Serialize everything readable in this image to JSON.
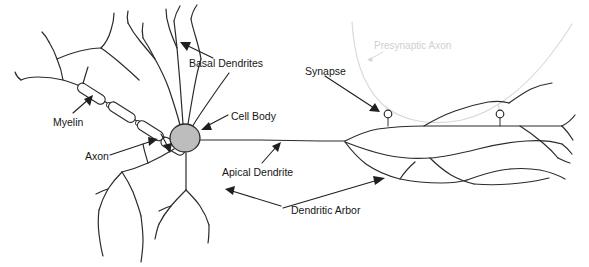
{
  "figure": {
    "background_color": "#ffffff",
    "width": 589,
    "height": 267
  },
  "colors": {
    "ink": "#2b2b2b",
    "label_text": "#161616",
    "faint": "#d8d8d8",
    "faint_text": "#cfcfcf",
    "soma_fill": "#bdbdbd",
    "terminal_fill": "#ffffff"
  },
  "labels": {
    "basal_dendrites": "Basal Dendrites",
    "myelin": "Myelin",
    "axon": "Axon",
    "cell_body": "Cell Body",
    "apical_dendrite": "Apical Dendrite",
    "dendritic_arbor": "Dendritic Arbor",
    "synapse": "Synapse",
    "presynaptic_axon": "Presynaptic Axon"
  },
  "structures": {
    "soma": {
      "name": "cell-body",
      "cx": 185,
      "cy": 138,
      "rx": 15,
      "ry": 14,
      "fill": "#bdbdbd"
    },
    "myelin_segments": 4,
    "nodes_of_ranvier": 4,
    "synaptic_terminals": [
      {
        "x": 388,
        "y": 114
      },
      {
        "x": 500,
        "y": 114
      }
    ],
    "presynaptic_axon_style": "faint-gray-curve"
  },
  "annotations": [
    {
      "label": "Basal Dendrites",
      "points_to": "basal-dendrites",
      "arrow": true
    },
    {
      "label": "Myelin",
      "points_to": "myelin-sheath",
      "arrow": true
    },
    {
      "label": "Axon",
      "points_to": "axon-hillock",
      "arrow": true
    },
    {
      "label": "Cell Body",
      "points_to": "soma",
      "arrow": true
    },
    {
      "label": "Apical Dendrite",
      "points_to": "apical-dendrite",
      "arrow": true
    },
    {
      "label": "Dendritic Arbor",
      "points_to": "dendritic-arbor",
      "arrow": true
    },
    {
      "label": "Synapse",
      "points_to": "synaptic-terminal",
      "arrow": true
    },
    {
      "label": "Presynaptic Axon",
      "points_to": "presynaptic-axon",
      "arrow": true
    }
  ]
}
